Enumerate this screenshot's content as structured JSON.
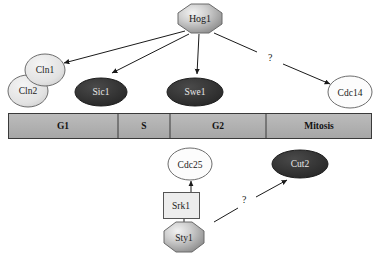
{
  "diagram": {
    "background_color": "#ffffff",
    "nodes": [
      {
        "id": "hog1",
        "label": "Hog1",
        "shape": "octagon",
        "fill": "#b4b4b4",
        "text_color": "#1a1a1a",
        "x": 178,
        "y": 4,
        "w": 44,
        "h": 28,
        "font_size": 10
      },
      {
        "id": "cln2",
        "label": "Cln2",
        "shape": "circle",
        "fill": "#e0e0e0",
        "text_color": "#1a1a1a",
        "x": 8,
        "y": 75,
        "w": 40,
        "h": 32,
        "font_size": 9.5
      },
      {
        "id": "cln1",
        "label": "Cln1",
        "shape": "circle",
        "fill": "#e0e0e0",
        "text_color": "#1a1a1a",
        "x": 25,
        "y": 54,
        "w": 40,
        "h": 32,
        "font_size": 9.5
      },
      {
        "id": "sic1",
        "label": "Sic1",
        "shape": "ellipse",
        "fill": "#2f2f2f",
        "text_color": "#e8e8e8",
        "x": 75,
        "y": 78,
        "w": 52,
        "h": 28,
        "font_size": 9.5
      },
      {
        "id": "swe1",
        "label": "Swe1",
        "shape": "ellipse",
        "fill": "#2f2f2f",
        "text_color": "#e8e8e8",
        "x": 167,
        "y": 78,
        "w": 56,
        "h": 28,
        "font_size": 9.5
      },
      {
        "id": "cdc14",
        "label": "Cdc14",
        "shape": "circle",
        "fill": "#fcfcfc",
        "text_color": "#1a1a1a",
        "x": 328,
        "y": 76,
        "w": 44,
        "h": 33,
        "font_size": 9.5
      },
      {
        "id": "cdc25",
        "label": "Cdc25",
        "shape": "circle",
        "fill": "#fcfcfc",
        "text_color": "#1a1a1a",
        "x": 168,
        "y": 148,
        "w": 44,
        "h": 33,
        "font_size": 9.5
      },
      {
        "id": "cut2",
        "label": "Cut2",
        "shape": "ellipse",
        "fill": "#2f2f2f",
        "text_color": "#e8e8e8",
        "x": 272,
        "y": 150,
        "w": 56,
        "h": 28,
        "font_size": 9.5
      },
      {
        "id": "srk1",
        "label": "Srk1",
        "shape": "rectangle",
        "fill": "#ededed",
        "text_color": "#1a1a1a",
        "x": 163,
        "y": 192,
        "w": 36,
        "h": 26,
        "font_size": 9.5
      },
      {
        "id": "sty1",
        "label": "Sty1",
        "shape": "octagon",
        "fill": "#b4b4b4",
        "text_color": "#1a1a1a",
        "x": 164,
        "y": 222,
        "w": 40,
        "h": 30,
        "font_size": 9.5
      }
    ],
    "edges": [
      {
        "id": "hog1-cln",
        "from": "hog1",
        "to": "cln1",
        "label": "",
        "x1": 185,
        "y1": 31,
        "x2": 62,
        "y2": 63
      },
      {
        "id": "hog1-sic1",
        "from": "hog1",
        "to": "sic1",
        "label": "",
        "x1": 188,
        "y1": 33,
        "x2": 110,
        "y2": 73
      },
      {
        "id": "hog1-swe1",
        "from": "hog1",
        "to": "swe1",
        "label": "",
        "x1": 199,
        "y1": 34,
        "x2": 196,
        "y2": 75
      },
      {
        "id": "hog1-cdc14",
        "from": "hog1",
        "to": "cdc14",
        "label": "?",
        "x1": 215,
        "y1": 33,
        "x2": 330,
        "y2": 83,
        "label_x": 271,
        "label_y": 58
      },
      {
        "id": "srk1-cdc25",
        "from": "srk1",
        "to": "cdc25",
        "label": "",
        "x1": 191,
        "y1": 192,
        "x2": 191,
        "y2": 180
      },
      {
        "id": "sty1-srk1",
        "from": "sty1",
        "to": "srk1",
        "label": "",
        "x1": 184,
        "y1": 222,
        "x2": 184,
        "y2": 219
      },
      {
        "id": "sty1-cut2",
        "from": "sty1",
        "to": "cut2",
        "label": "?",
        "x1": 218,
        "y1": 221,
        "x2": 285,
        "y2": 180,
        "label_x": 245,
        "label_y": 200
      }
    ],
    "cell_cycle_bar": {
      "id": "cell-cycle-bar",
      "x": 8,
      "y": 113,
      "width": 364,
      "height": 26,
      "fill": "#b0b0b0",
      "border_color": "#3a3a3a",
      "phases": [
        {
          "id": "g1",
          "label": "G1",
          "start": 8,
          "width": 110
        },
        {
          "id": "s",
          "label": "S",
          "start": 118,
          "width": 52
        },
        {
          "id": "g2",
          "label": "G2",
          "start": 170,
          "width": 96
        },
        {
          "id": "mitosis",
          "label": "Mitosis",
          "start": 266,
          "width": 106
        }
      ]
    }
  }
}
